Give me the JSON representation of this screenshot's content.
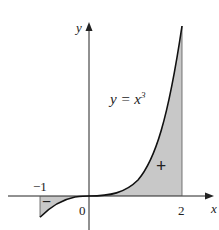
{
  "figure": {
    "equation_label": "y = x",
    "equation_exponent": "3",
    "axis_labels": {
      "x": "x",
      "y": "y"
    },
    "tick_labels": {
      "neg_one": "−1",
      "zero": "0",
      "two": "2"
    },
    "region_signs": {
      "negative": "−",
      "positive": "+"
    },
    "colors": {
      "curve": "#111111",
      "shade": "#c8c8c8",
      "axis": "#222222"
    },
    "function": "x^3",
    "domain": [
      -1,
      2
    ]
  }
}
